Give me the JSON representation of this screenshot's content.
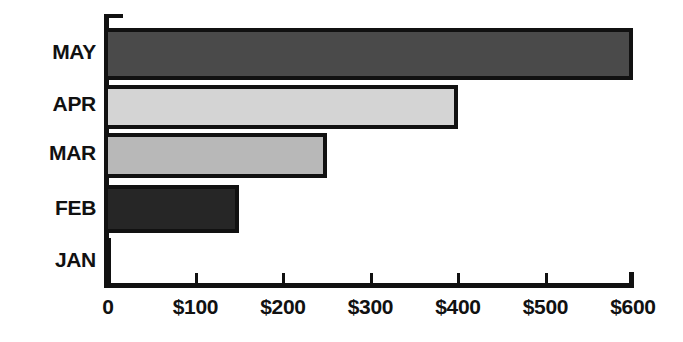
{
  "chart_data": {
    "type": "bar",
    "orientation": "horizontal",
    "title": "",
    "subtitle": "",
    "xlabel": "",
    "ylabel": "",
    "categories": [
      "MAY",
      "APR",
      "MAR",
      "FEB",
      "JAN"
    ],
    "values": [
      600,
      400,
      250,
      150,
      0
    ],
    "value_prefix": "$",
    "xlim": [
      0,
      600
    ],
    "xticks": [
      0,
      100,
      200,
      300,
      400,
      500,
      600
    ],
    "xtick_labels": [
      "0",
      "$100",
      "$200",
      "$300",
      "$400",
      "$500",
      "$600"
    ],
    "grid": false,
    "legend": false,
    "bar_colors": [
      "#4a4a4a",
      "#d4d4d4",
      "#b8b8b8",
      "#262626",
      "#ffffff"
    ],
    "bar_edge_color": "#111111",
    "axis_color": "#111111",
    "background": "#ffffff",
    "bars": [
      {
        "category": "MAY",
        "value": 600,
        "label": "$600",
        "fill": "#4a4a4a"
      },
      {
        "category": "APR",
        "value": 400,
        "label": "$400",
        "fill": "#d4d4d4"
      },
      {
        "category": "MAR",
        "value": 250,
        "label": "$250",
        "fill": "#b8b8b8"
      },
      {
        "category": "FEB",
        "value": 150,
        "label": "$150",
        "fill": "#262626"
      },
      {
        "category": "JAN",
        "value": 0,
        "label": "$0",
        "fill": "#ffffff"
      }
    ]
  },
  "layout": {
    "axis_origin_x": 108,
    "axis_baseline_y": 283,
    "px_per_unit": 0.875,
    "rows": [
      {
        "category": "MAY",
        "top": 28,
        "height": 52,
        "label_y": 41
      },
      {
        "category": "APR",
        "top": 85,
        "height": 44,
        "label_y": 93
      },
      {
        "category": "MAR",
        "top": 133,
        "height": 45,
        "label_y": 142
      },
      {
        "category": "FEB",
        "top": 185,
        "height": 48,
        "label_y": 197
      },
      {
        "category": "JAN",
        "top": 238,
        "height": 45,
        "label_y": 249
      }
    ]
  }
}
